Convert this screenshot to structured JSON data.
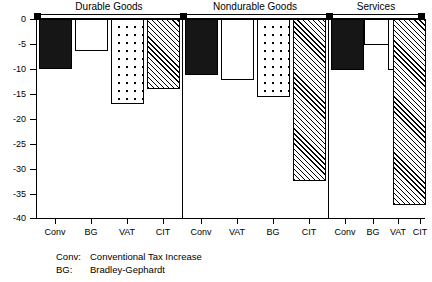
{
  "chart_data": {
    "type": "bar",
    "title": "",
    "xlabel": "",
    "ylabel": "",
    "ylim": [
      -40,
      0
    ],
    "yticks": [
      0,
      -5,
      -10,
      -15,
      -20,
      -25,
      -30,
      -35,
      -40
    ],
    "ytick_labels": [
      "0",
      "-5",
      "-10",
      "-15",
      "-20",
      "-25",
      "-30",
      "-35",
      "-40"
    ],
    "grid": false,
    "legend_position": "below-axis",
    "group_labels": [
      "Durable Goods",
      "Nondurable Goods",
      "Services"
    ],
    "categories": [
      "Conv",
      "BG",
      "VAT",
      "CIT",
      "Conv",
      "VAT",
      "BG",
      "CIT",
      "Conv",
      "BG",
      "VAT",
      "CIT"
    ],
    "groups": [
      {
        "name": "Durable Goods",
        "bars": [
          {
            "label": "Conv",
            "value": -10.0,
            "fill": "solid"
          },
          {
            "label": "BG",
            "value": -6.4,
            "fill": "open"
          },
          {
            "label": "VAT",
            "value": -17.0,
            "fill": "dots"
          },
          {
            "label": "CIT",
            "value": -14.1,
            "fill": "hatch"
          }
        ]
      },
      {
        "name": "Nondurable Goods",
        "bars": [
          {
            "label": "Conv",
            "value": -11.3,
            "fill": "solid"
          },
          {
            "label": "VAT",
            "value": -12.3,
            "fill": "open"
          },
          {
            "label": "BG",
            "value": -15.7,
            "fill": "dots"
          },
          {
            "label": "CIT",
            "value": -32.5,
            "fill": "hatch"
          }
        ]
      },
      {
        "name": "Services",
        "bars": [
          {
            "label": "Conv",
            "value": -10.3,
            "fill": "solid"
          },
          {
            "label": "BG",
            "value": -5.2,
            "fill": "open"
          },
          {
            "label": "VAT",
            "value": -10.3,
            "fill": "dots"
          },
          {
            "label": "CIT",
            "value": -37.3,
            "fill": "hatch"
          }
        ]
      }
    ],
    "values": [
      -10.0,
      -6.4,
      -17.0,
      -14.1,
      -11.3,
      -12.3,
      -15.7,
      -32.5,
      -10.3,
      -5.2,
      -10.3,
      -37.3
    ]
  },
  "legend": {
    "rows": [
      {
        "key": "Conv:",
        "desc": "Conventional Tax Increase"
      },
      {
        "key": "BG:",
        "desc": "Bradley-Gephardt"
      }
    ]
  }
}
